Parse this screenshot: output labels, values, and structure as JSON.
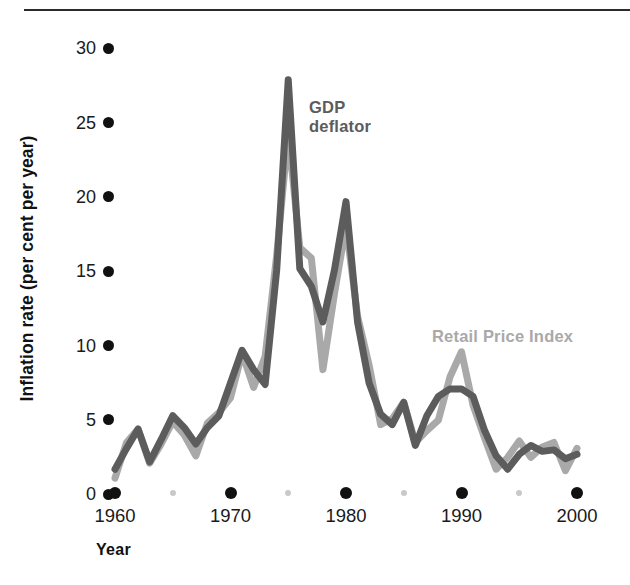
{
  "figure": {
    "y_axis_title": "Inflation rate (per cent per year)",
    "x_axis_title": "Year",
    "gdp_label": "GDP\ndeflator",
    "rpi_label": "Retail Price Index",
    "gdp_color": "#5c5c5c",
    "rpi_color": "#a9a9a9",
    "tick_color": "#111111",
    "minor_tick_color": "#c9c9c9",
    "background": "#ffffff"
  },
  "chart_data": {
    "type": "line",
    "title": "",
    "subtitle": "",
    "xlabel": "Year",
    "ylabel": "Inflation rate (per cent per year)",
    "xlim": [
      1960,
      2000
    ],
    "ylim": [
      0,
      30
    ],
    "xticks": [
      1960,
      1970,
      1980,
      1990,
      2000
    ],
    "xtick_labels": [
      "1960",
      "1970",
      "1980",
      "1990",
      "2000"
    ],
    "minor_xticks": [
      1965,
      1975,
      1985,
      1995
    ],
    "yticks": [
      0,
      5,
      10,
      15,
      20,
      25,
      30
    ],
    "ytick_labels": [
      "0",
      "5",
      "10",
      "15",
      "20",
      "25",
      "30"
    ],
    "grid": false,
    "legend": "inline-annotations",
    "x": [
      1960,
      1961,
      1962,
      1963,
      1964,
      1965,
      1966,
      1967,
      1968,
      1969,
      1970,
      1971,
      1972,
      1973,
      1974,
      1975,
      1976,
      1977,
      1978,
      1979,
      1980,
      1981,
      1982,
      1983,
      1984,
      1985,
      1986,
      1987,
      1988,
      1989,
      1990,
      1991,
      1992,
      1993,
      1994,
      1995,
      1996,
      1997,
      1998,
      1999,
      2000
    ],
    "series": [
      {
        "name": "GDP deflator",
        "color": "#5c5c5c",
        "values": [
          1.6,
          3.0,
          4.3,
          2.1,
          3.6,
          5.2,
          4.4,
          3.3,
          4.4,
          5.2,
          7.4,
          9.6,
          8.3,
          7.3,
          15.0,
          27.8,
          15.1,
          13.9,
          11.5,
          15.0,
          19.6,
          11.5,
          7.4,
          5.3,
          4.6,
          6.1,
          3.2,
          5.2,
          6.5,
          7.0,
          7.0,
          6.5,
          4.2,
          2.5,
          1.6,
          2.6,
          3.2,
          2.8,
          2.9,
          2.3,
          2.6
        ]
      },
      {
        "name": "Retail Price Index",
        "color": "#a9a9a9",
        "values": [
          1.0,
          3.4,
          4.3,
          2.0,
          3.3,
          4.8,
          3.9,
          2.5,
          4.7,
          5.4,
          6.4,
          9.4,
          7.1,
          9.2,
          16.0,
          24.2,
          16.5,
          15.8,
          8.3,
          13.4,
          18.0,
          11.9,
          8.6,
          4.6,
          5.0,
          6.1,
          3.4,
          4.2,
          4.9,
          7.8,
          9.5,
          5.9,
          3.7,
          1.6,
          2.4,
          3.5,
          2.4,
          3.1,
          3.4,
          1.5,
          3.0
        ]
      }
    ]
  }
}
